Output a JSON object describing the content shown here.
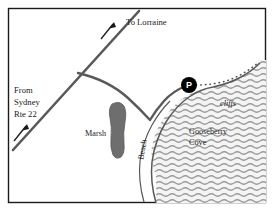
{
  "figure": {
    "kind": "hand-drawn-locator-map",
    "width": 274,
    "height": 211,
    "background_color": "#ffffff",
    "border_color": "#1a1a1a"
  },
  "colors": {
    "border": "#1a1a1a",
    "road": "#595959",
    "coastline": "#595959",
    "marsh_fill": "#6e6e6e",
    "water_wave": "#9a9a9a",
    "water_fill": "#f2f2f2",
    "trail_dots": "#4d4d4d",
    "parking_marker": "#000000",
    "parking_text": "#ffffff",
    "text": "#1a1a1a"
  },
  "labels": {
    "to_lorraine": "To Lorraine",
    "from_sydney_line1": "From",
    "from_sydney_line2": "Sydney",
    "from_sydney_line3": "Rte 22",
    "marsh": "Marsh",
    "beach": "Beach",
    "cliffs": "cliffs",
    "cove_line1": "Gooseberry",
    "cove_line2": "Cove",
    "parking": "P"
  },
  "features": [
    {
      "id": "main-road",
      "name": "main-road",
      "type": "road",
      "description": "Diagonal road running from lower-left to upper-right across the map"
    },
    {
      "id": "side-road",
      "name": "side-road-to-parking",
      "type": "road",
      "description": "Branch road leaving the main road junction, curving right and down to the parking area at the cove"
    },
    {
      "id": "marsh",
      "name": "marsh-area",
      "type": "wetland",
      "description": "Shaded boomerang-shaped marsh west of the beach"
    },
    {
      "id": "gooseberry-cove",
      "name": "gooseberry-cove-water",
      "type": "water",
      "description": "Wave-hatched cove filling the lower-right of the map"
    },
    {
      "id": "beach",
      "name": "beach-strip",
      "type": "shoreline",
      "description": "Narrow beach strip along the western edge of the cove"
    },
    {
      "id": "cliffs",
      "name": "cliffs-area",
      "type": "landform",
      "description": "Cliffs along the northeastern shore of the cove"
    },
    {
      "id": "trail",
      "name": "dotted-trail",
      "type": "trail",
      "description": "Dotted footpath leading east from the parking area along the cliff tops"
    },
    {
      "id": "parking",
      "name": "parking-marker",
      "type": "point-of-interest",
      "description": "Black circular parking marker labelled P at the head of the cove"
    }
  ],
  "direction_arrows": [
    {
      "id": "arrow-lorraine",
      "name": "arrow-to-lorraine",
      "points_toward": "To Lorraine",
      "heading": "northeast"
    },
    {
      "id": "arrow-sydney",
      "name": "arrow-from-sydney",
      "points_toward": "From Sydney Rte 22",
      "heading": "northeast"
    }
  ]
}
